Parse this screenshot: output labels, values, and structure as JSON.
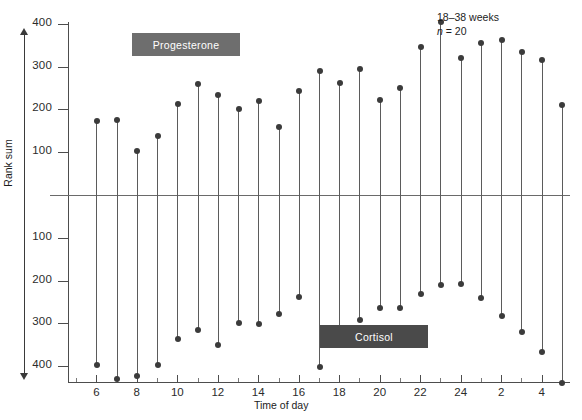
{
  "chart_data": {
    "type": "bar",
    "title": "",
    "subtitle": "",
    "xlabel": "Time of day",
    "ylabel": "Rank sum",
    "xlim": [
      4.6,
      29.4
    ],
    "ylim": [
      -460,
      460
    ],
    "grid": false,
    "legend_position": "inside-plot",
    "zero_reference_line": 0,
    "x_tick_labels": [
      "6",
      "8",
      "10",
      "12",
      "14",
      "16",
      "18",
      "20",
      "22",
      "24",
      "2",
      "4"
    ],
    "x_tick_values": [
      6,
      8,
      10,
      12,
      14,
      16,
      18,
      20,
      22,
      24,
      26,
      28
    ],
    "x_minor_tick_values": [
      5,
      7,
      9,
      11,
      13,
      15,
      17,
      19,
      21,
      23,
      25,
      27,
      29
    ],
    "y_tick_labels_upper": [
      "400",
      "300",
      "200",
      "100"
    ],
    "y_tick_values_upper": [
      400,
      300,
      200,
      100
    ],
    "y_tick_labels_lower": [
      "100",
      "200",
      "300",
      "400"
    ],
    "y_tick_values_lower": [
      -100,
      -200,
      -300,
      -400
    ],
    "x": [
      6,
      7,
      8,
      9,
      10,
      11,
      12,
      13,
      14,
      15,
      16,
      17,
      18,
      19,
      20,
      21,
      22,
      23,
      24,
      25,
      26,
      27,
      28,
      29
    ],
    "x_hour_labels": [
      "6",
      "7",
      "8",
      "9",
      "10",
      "11",
      "12",
      "13",
      "14",
      "15",
      "16",
      "17",
      "18",
      "19",
      "20",
      "21",
      "22",
      "23",
      "24",
      "1",
      "2",
      "3",
      "4",
      "5"
    ],
    "series": [
      {
        "name": "Progesterone",
        "color": "#6e6e6e",
        "label_box_color": "#6e6e6e",
        "values": [
          172,
          175,
          103,
          137,
          212,
          260,
          233,
          200,
          220,
          160,
          243,
          290,
          262,
          295,
          222,
          250,
          345,
          404,
          320,
          355,
          362,
          335,
          315,
          210
        ]
      },
      {
        "name": "Cortisol",
        "color": "#4a4a4a",
        "label_box_color": "#4a4a4a",
        "values": [
          -397,
          -430,
          -422,
          -397,
          -337,
          -315,
          -351,
          -299,
          -302,
          -277,
          -238,
          -402,
          -330,
          -292,
          -265,
          -263,
          -232,
          -210,
          -208,
          -240,
          -282,
          -320,
          -367,
          -440
        ]
      }
    ],
    "annotations": [
      {
        "text": "18–38 weeks",
        "x": 24.6,
        "y": 440
      },
      {
        "text_prefix": "n",
        "text_suffix": " = 20",
        "x": 24.6,
        "y": 408
      }
    ],
    "point_marker": "filled-circle",
    "stem_style": "vertical-line-from-zero"
  },
  "axis": {
    "y_label": "Rank sum",
    "x_label": "Time of day"
  },
  "legend": {
    "progesterone_label": "Progesterone",
    "cortisol_label": "Cortisol"
  },
  "annotation": {
    "weeks": "18–38 weeks",
    "n_symbol": "n",
    "n_value": " = 20"
  },
  "colors": {
    "progesterone_box": "#6e6e6e",
    "cortisol_box": "#4a4a4a",
    "point": "#3b3b3b",
    "stem": "#5b5b5b",
    "axis": "#4d4d4d",
    "background": "#ffffff"
  }
}
